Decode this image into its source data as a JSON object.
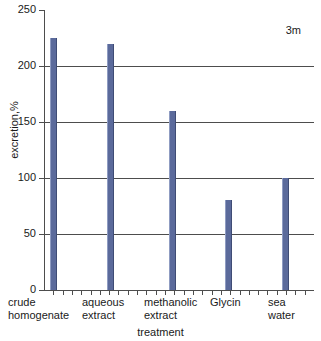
{
  "chart_data": {
    "type": "bar",
    "title": "",
    "subtitle": "",
    "annotation": "3m",
    "xlabel": "treatment",
    "ylabel": "excretion,%",
    "categories": [
      "crude homogenate",
      "aqueous extract",
      "methanolic extract",
      "Glycin",
      "sea water"
    ],
    "category_lines": [
      [
        "crude",
        "homogenate"
      ],
      [
        "aqueous",
        "extract"
      ],
      [
        "methanolic",
        "extract"
      ],
      [
        "Glycin",
        ""
      ],
      [
        "sea",
        "water"
      ]
    ],
    "values": [
      225,
      220,
      160,
      80,
      100
    ],
    "ylim": [
      0,
      250
    ],
    "ytick_labels": [
      "250",
      "200",
      "150",
      "100",
      "50",
      "0"
    ],
    "ytick_values": [
      250,
      200,
      150,
      100,
      50,
      0
    ],
    "grid": true,
    "grid_axis": "y",
    "legend": "none",
    "bar_color": "#5b6a9b",
    "axis_color": "#4d4d4d",
    "background_color": "#ffffff"
  }
}
